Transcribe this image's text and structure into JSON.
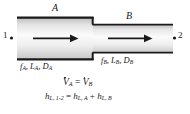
{
  "figure": {
    "background_color": "#ffffff",
    "line_color": "#1a1a1a",
    "pipe_fill_light": "#fdfdfd",
    "pipe_fill_dark": "#c9c9c9"
  },
  "labels": {
    "section_a": "A",
    "section_b": "B",
    "station_1": "1",
    "station_2": "2",
    "props_a_f": "f",
    "props_a_f_sub": "A",
    "props_a_l": "L",
    "props_a_l_sub": "A",
    "props_a_d": "D",
    "props_a_d_sub": "A",
    "props_b_f": "f",
    "props_b_f_sub": "B",
    "props_b_l": "L",
    "props_b_l_sub": "B",
    "props_b_d": "D",
    "props_b_d_sub": "B",
    "comma": ", "
  },
  "equations": {
    "flow_lhs_symbol": "V",
    "flow_lhs_sub": "A",
    "flow_equals": " = ",
    "flow_rhs_symbol": "V",
    "flow_rhs_sub": "B",
    "head_lhs_symbol": "h",
    "head_lhs_sub": "L, 1-2",
    "head_equals": " = ",
    "head_term1_symbol": "h",
    "head_term1_sub": "L, A",
    "head_plus": " + ",
    "head_term2_symbol": "h",
    "head_term2_sub": "L, B"
  },
  "arrows": {
    "flow_a": "flow-arrow-a",
    "flow_b": "flow-arrow-b"
  }
}
